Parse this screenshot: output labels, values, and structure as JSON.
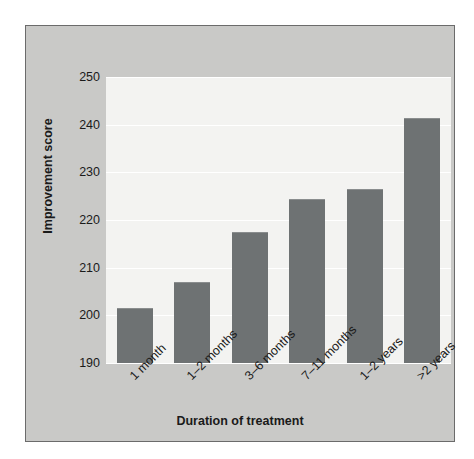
{
  "chart_data": {
    "type": "bar",
    "title": "",
    "xlabel": "Duration of treatment",
    "ylabel": "Improvement score",
    "categories": [
      "1 month",
      "1–2 months",
      "3–6 months",
      "7–11 months",
      "1–2 years",
      ">2 years"
    ],
    "values": [
      201.5,
      207,
      217.5,
      224.5,
      226.5,
      241.5
    ],
    "ylim": [
      190,
      250
    ],
    "yticks": [
      190,
      200,
      210,
      220,
      230,
      240,
      250
    ],
    "ytick_labels": [
      "190",
      "200",
      "210",
      "220",
      "230",
      "240",
      "250"
    ],
    "grid": true,
    "grid_axis": "y",
    "legend": "none",
    "bar_color": "#6e7273",
    "plot_background": "#f3f3f1",
    "figure_background": "#c9c9c7",
    "frame_color": "#6b6b6b",
    "gridline_color": "#ffffff",
    "xtick_rotation": -45
  }
}
